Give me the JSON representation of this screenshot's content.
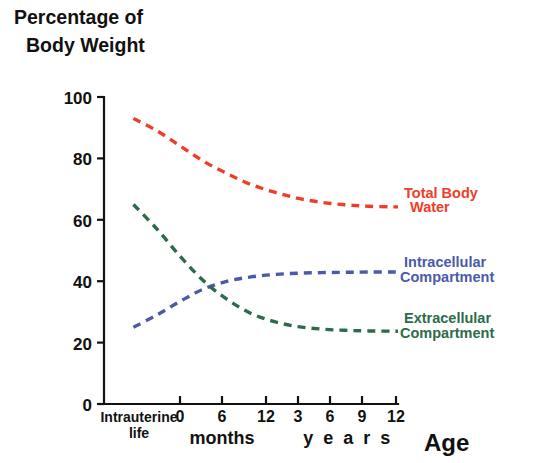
{
  "chart_data": {
    "type": "line",
    "title": "Percentage of Body Weight",
    "title_line1": "Percentage of",
    "title_line2": "Body Weight",
    "xlabel": "Age",
    "ylabel": "Percentage of Body Weight",
    "ylim": [
      0,
      100
    ],
    "yticks": [
      0,
      20,
      40,
      60,
      80,
      100
    ],
    "ytick_labels": [
      "0",
      "20",
      "40",
      "60",
      "80",
      "100"
    ],
    "grid": false,
    "legend_position": "right-inline",
    "x_axis_groups": [
      {
        "name": "intrauterine",
        "label_line1": "Intrauterine",
        "label_line2": "life",
        "ticks": []
      },
      {
        "name": "months",
        "label": "months",
        "ticks": [
          "0",
          "6",
          "12"
        ]
      },
      {
        "name": "years",
        "label": "y e a r s",
        "ticks": [
          "3",
          "6",
          "9",
          "12"
        ]
      }
    ],
    "x_tick_labels": [
      "0",
      "6",
      "12",
      "3",
      "6",
      "9",
      "12"
    ],
    "series": [
      {
        "name": "Total Body Water",
        "label_line1": "Total Body",
        "label_line2": "Water",
        "color": "#f03c28",
        "style": "dashed",
        "points": [
          {
            "x": 0.1,
            "y": 93
          },
          {
            "x": 0.18,
            "y": 89
          },
          {
            "x": 0.26,
            "y": 84
          },
          {
            "x": 0.34,
            "y": 79
          },
          {
            "x": 0.42,
            "y": 75
          },
          {
            "x": 0.5,
            "y": 71.5
          },
          {
            "x": 0.58,
            "y": 69
          },
          {
            "x": 0.66,
            "y": 67
          },
          {
            "x": 0.74,
            "y": 65.7
          },
          {
            "x": 0.82,
            "y": 64.9
          },
          {
            "x": 0.9,
            "y": 64.4
          },
          {
            "x": 1.0,
            "y": 64.2
          }
        ]
      },
      {
        "name": "Intracellular Compartment",
        "label_line1": "Intracellular",
        "label_line2": "Compartment",
        "color": "#4a5aa8",
        "style": "dashed",
        "points": [
          {
            "x": 0.1,
            "y": 25
          },
          {
            "x": 0.18,
            "y": 29
          },
          {
            "x": 0.26,
            "y": 33.5
          },
          {
            "x": 0.34,
            "y": 37.5
          },
          {
            "x": 0.42,
            "y": 40
          },
          {
            "x": 0.5,
            "y": 41.4
          },
          {
            "x": 0.58,
            "y": 42.2
          },
          {
            "x": 0.66,
            "y": 42.6
          },
          {
            "x": 0.74,
            "y": 42.8
          },
          {
            "x": 0.82,
            "y": 42.9
          },
          {
            "x": 0.9,
            "y": 43
          },
          {
            "x": 1.0,
            "y": 43
          }
        ]
      },
      {
        "name": "Extracellular Compartment",
        "label_line1": "Extracellular",
        "label_line2": "Compartment",
        "color": "#2d6b4a",
        "style": "dashed",
        "points": [
          {
            "x": 0.1,
            "y": 65
          },
          {
            "x": 0.18,
            "y": 57
          },
          {
            "x": 0.26,
            "y": 48
          },
          {
            "x": 0.34,
            "y": 40
          },
          {
            "x": 0.42,
            "y": 34
          },
          {
            "x": 0.5,
            "y": 29.5
          },
          {
            "x": 0.58,
            "y": 26.8
          },
          {
            "x": 0.66,
            "y": 25.2
          },
          {
            "x": 0.74,
            "y": 24.4
          },
          {
            "x": 0.82,
            "y": 24
          },
          {
            "x": 0.9,
            "y": 23.8
          },
          {
            "x": 1.0,
            "y": 23.7
          }
        ]
      }
    ]
  },
  "geometry": {
    "plot_left": 104,
    "plot_right": 398,
    "plot_top": 97,
    "plot_bottom": 404,
    "x_tick_positions": [
      180,
      222,
      266,
      298,
      330,
      362,
      396
    ],
    "months_group_center": 222,
    "years_group_center": 346,
    "intrauterine_center": 138,
    "axis_name_x": 424,
    "axis_name_y": 449,
    "series_label_x": 404,
    "series_label_y": [
      193,
      262,
      318
    ]
  }
}
